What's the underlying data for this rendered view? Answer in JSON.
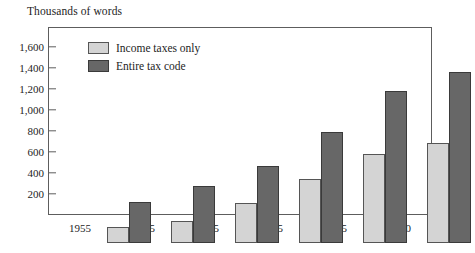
{
  "chart_data": {
    "type": "bar",
    "title": "Thousands of words",
    "subtitle": "",
    "xlabel": "",
    "ylabel": "Thousands of words",
    "categories": [
      "1955",
      "1965",
      "1975",
      "1985",
      "1995",
      "2000"
    ],
    "series": [
      {
        "name": "Income taxes only",
        "color": "#d4d4d4",
        "values": [
          155,
          205,
          380,
          610,
          850,
          950
        ]
      },
      {
        "name": "Entire tax code",
        "color": "#676767",
        "values": [
          390,
          540,
          730,
          1055,
          1450,
          1630
        ]
      }
    ],
    "ylim": [
      0,
      1790
    ],
    "yticks": [
      200,
      400,
      600,
      800,
      1000,
      1200,
      1400,
      1600
    ],
    "ytick_labels": [
      "200",
      "400",
      "600",
      "800",
      "1,000",
      "1,200",
      "1,400",
      "1,600"
    ],
    "grid": false,
    "legend_position": "top-left",
    "frame_color": "#5d5d5d",
    "background_color": "#ffffff",
    "text_color": "#1d1d1d"
  },
  "legend": {
    "items": [
      {
        "label": "Income taxes only",
        "swatch": "light-gray-swatch"
      },
      {
        "label": "Entire tax code",
        "swatch": "dark-gray-swatch"
      }
    ]
  }
}
